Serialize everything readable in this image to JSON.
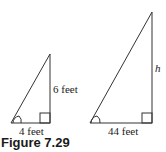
{
  "figure": {
    "caption": "Figure 7.29",
    "small_triangle": {
      "base_label": "4 feet",
      "height_label": "6 feet"
    },
    "large_triangle": {
      "base_label": "44 feet",
      "height_label": "h"
    }
  }
}
